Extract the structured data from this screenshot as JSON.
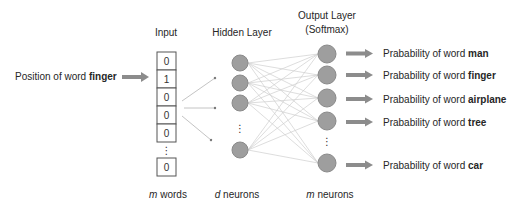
{
  "headers": {
    "input": "Input",
    "hidden": "Hidden Layer",
    "output_line1": "Output Layer",
    "output_line2": "(Softmax)"
  },
  "input_label": {
    "prefix": "Position of word ",
    "word": "finger"
  },
  "input_vector": [
    "0",
    "1",
    "0",
    "0",
    "0",
    "⋮",
    "0"
  ],
  "hidden_layer": {
    "visible_neurons": 4,
    "ellipsis": "⋮"
  },
  "output_layer": {
    "visible_neurons": 5,
    "ellipsis": "⋮"
  },
  "outputs": [
    {
      "prefix": "Prabability of word ",
      "word": "man"
    },
    {
      "prefix": "Prabability of word ",
      "word": "finger"
    },
    {
      "prefix": "Prabability of word ",
      "word": "airplane"
    },
    {
      "prefix": "Prabability of word ",
      "word": "tree"
    },
    {
      "prefix": "Prabability of word ",
      "word": "car"
    }
  ],
  "footers": {
    "input": {
      "var": "m",
      "text": " words"
    },
    "hidden": {
      "var": "d",
      "text": " neurons"
    },
    "output": {
      "var": "m",
      "text": " neurons"
    }
  },
  "colors": {
    "node_fill": "#9e9e9e",
    "node_stroke": "#8a8a8a",
    "arrow": "#8c8c8c",
    "edge": "#c8c8c8",
    "box_stroke": "#555555"
  }
}
